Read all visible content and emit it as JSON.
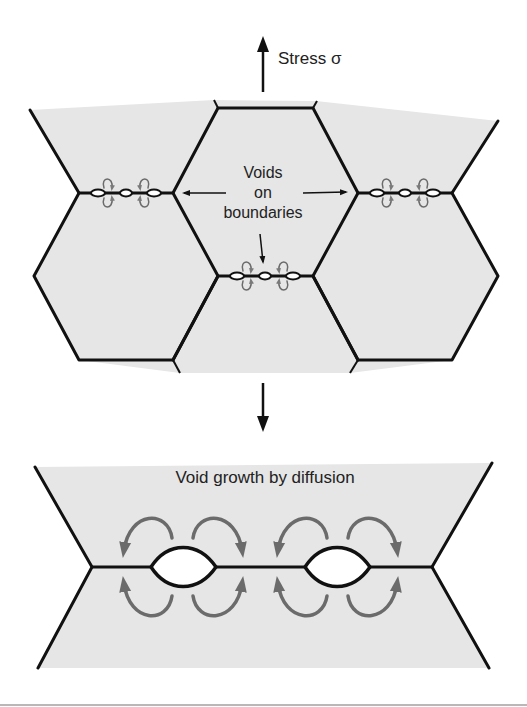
{
  "figure": {
    "top_panel": {
      "stress_label": "Stress σ",
      "callout_label_line1": "Voids",
      "callout_label_line2": "on",
      "callout_label_line3": "boundaries"
    },
    "bottom_panel": {
      "title": "Void growth by diffusion"
    },
    "colors": {
      "grain_fill": "#e6e6e6",
      "boundary_line": "#111111",
      "diffusion_arrow": "#6b6b6b",
      "void_fill": "#ffffff",
      "background": "#ffffff"
    },
    "icons": {
      "stress_up_arrow": "arrow-up-icon",
      "stress_down_arrow": "arrow-down-icon"
    }
  }
}
